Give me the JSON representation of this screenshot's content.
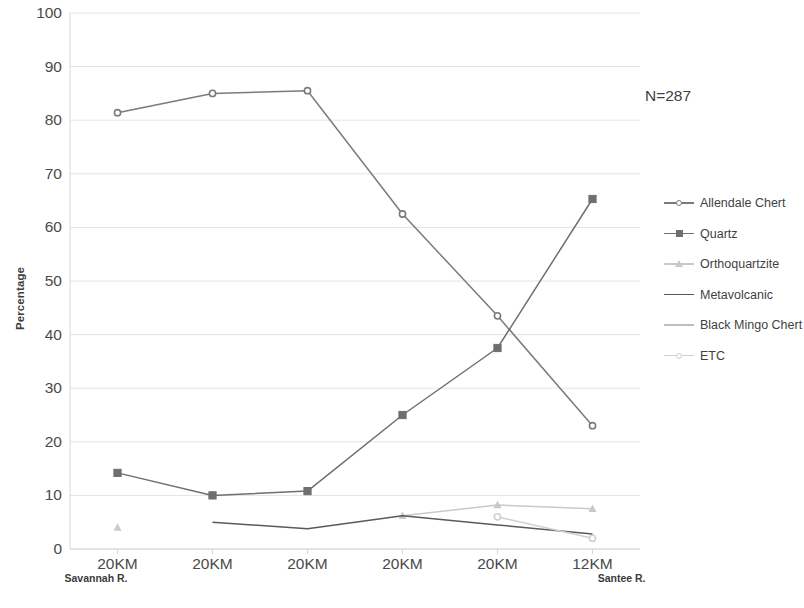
{
  "annotation": {
    "n_label": "N=287"
  },
  "axes": {
    "y_title": "Percentage",
    "y_ticks": [
      "0",
      "10",
      "20",
      "30",
      "40",
      "50",
      "60",
      "70",
      "80",
      "90",
      "100"
    ],
    "x_ticks": [
      "20KM",
      "20KM",
      "20KM",
      "20KM",
      "20KM",
      "12KM"
    ],
    "x_left_river": "Savannah R.",
    "x_right_river": "Santee R."
  },
  "legend": {
    "items": [
      {
        "label": "Allendale Chert",
        "marker": "circle-icon",
        "color": "#7b7b7b"
      },
      {
        "label": "Quartz",
        "marker": "square-icon",
        "color": "#6f6f6f"
      },
      {
        "label": "Orthoquartzite",
        "marker": "triangle-icon",
        "color": "#c9c9c9"
      },
      {
        "label": "Metavolcanic",
        "marker": "line-icon",
        "color": "#5a5a5a"
      },
      {
        "label": "Black Mingo Chert",
        "marker": "line-icon",
        "color": "#bdbdbd"
      },
      {
        "label": "ETC",
        "marker": "circle-icon",
        "color": "#d0d0d0"
      }
    ]
  },
  "chart_data": {
    "type": "line",
    "title": "",
    "xlabel": "",
    "ylabel": "Percentage",
    "ylim": [
      0,
      100
    ],
    "ytick_step": 10,
    "grid": true,
    "legend_position": "right",
    "annotations": [
      "N=287"
    ],
    "categories": [
      "20KM",
      "20KM",
      "20KM",
      "20KM",
      "20KM",
      "12KM"
    ],
    "category_endpoints": {
      "left": "Savannah R.",
      "right": "Santee R."
    },
    "series": [
      {
        "name": "Allendale Chert",
        "color": "#7b7b7b",
        "marker": "circle",
        "values": [
          81.4,
          85.0,
          85.5,
          62.5,
          43.5,
          23.0
        ]
      },
      {
        "name": "Quartz",
        "color": "#6f6f6f",
        "marker": "square",
        "values": [
          14.2,
          10.0,
          10.8,
          25.0,
          37.5,
          65.3
        ]
      },
      {
        "name": "Orthoquartzite",
        "color": "#c9c9c9",
        "marker": "triangle",
        "values": [
          4.0,
          null,
          null,
          6.2,
          8.2,
          7.5
        ]
      },
      {
        "name": "Metavolcanic",
        "color": "#5a5a5a",
        "marker": "none",
        "values": [
          null,
          5.0,
          3.8,
          6.2,
          4.5,
          2.8
        ]
      },
      {
        "name": "Black Mingo Chert",
        "color": "#bdbdbd",
        "marker": "none",
        "values": [
          null,
          null,
          null,
          null,
          null,
          null
        ]
      },
      {
        "name": "ETC",
        "color": "#d0d0d0",
        "marker": "circle",
        "values": [
          null,
          null,
          null,
          null,
          6.0,
          2.0
        ]
      }
    ]
  }
}
